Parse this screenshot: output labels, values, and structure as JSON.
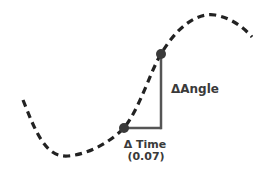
{
  "diagram": {
    "labels": {
      "delta_angle": "ΔAngle",
      "delta_time": "Δ Time",
      "delta_time_value": "(0.07)"
    },
    "colors": {
      "curve": "#222222",
      "marker": "#3a3a3a",
      "guide": "#555555",
      "text": "#3a3a3a"
    },
    "points": [
      {
        "name": "start-point",
        "x": 124,
        "y": 128
      },
      {
        "name": "end-point",
        "x": 161,
        "y": 54
      }
    ]
  }
}
